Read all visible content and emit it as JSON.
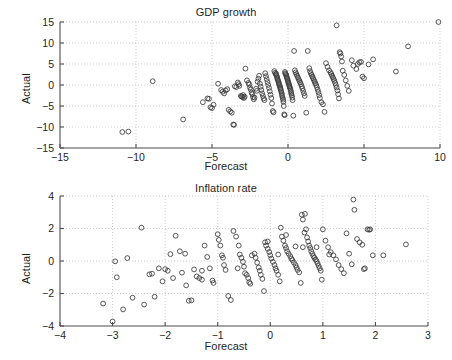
{
  "figure": {
    "background_color": "#ffffff",
    "axis_color": "#4d4d4d",
    "grid_color": "#b9b9b9",
    "marker_color": "#3a3a3a",
    "marker_shape": "open-circle"
  },
  "panels": [
    {
      "id": "gdp",
      "title": "GDP growth",
      "xlabel": "Forecast",
      "ylabel": "Actual"
    },
    {
      "id": "inflation",
      "title": "Inflation rate",
      "xlabel": "Forecast",
      "ylabel": "Actual"
    }
  ],
  "chart_data": [
    {
      "type": "scatter",
      "title": "GDP growth",
      "xlabel": "Forecast",
      "ylabel": "Actual",
      "xlim": [
        -15,
        10
      ],
      "ylim": [
        -15,
        15
      ],
      "xticks": [
        -15,
        -10,
        -5,
        0,
        5,
        10
      ],
      "yticks": [
        -15,
        -10,
        -5,
        0,
        5,
        10,
        15
      ],
      "xticklabels": [
        "−15",
        "−10",
        "−5",
        "0",
        "5",
        "10"
      ],
      "yticklabels": [
        "−15",
        "−10",
        "−5",
        "0",
        "5",
        "10",
        "15"
      ],
      "grid": true,
      "grid_style": "dotted",
      "legend": null,
      "marker": "o",
      "marker_filled": false,
      "points": [
        [
          -10.9,
          -11.2
        ],
        [
          -10.5,
          -11.1
        ],
        [
          -8.9,
          0.9
        ],
        [
          -6.9,
          -8.2
        ],
        [
          -5.6,
          -4.1
        ],
        [
          -5.3,
          -3.2
        ],
        [
          -5.2,
          -3.3
        ],
        [
          -5.1,
          -5.3
        ],
        [
          -5.0,
          -5.5
        ],
        [
          -4.9,
          -4.7
        ],
        [
          -4.6,
          0.3
        ],
        [
          -4.4,
          -1.2
        ],
        [
          -4.3,
          -1.6
        ],
        [
          -4.2,
          -2.0
        ],
        [
          -4.1,
          -1.3
        ],
        [
          -4.0,
          -1.0
        ],
        [
          -3.9,
          -5.9
        ],
        [
          -3.8,
          -6.3
        ],
        [
          -3.7,
          -6.6
        ],
        [
          -3.6,
          -9.4
        ],
        [
          -3.55,
          -9.5
        ],
        [
          -3.5,
          -0.3
        ],
        [
          -3.4,
          -0.5
        ],
        [
          -3.3,
          0.6
        ],
        [
          -3.25,
          0.2
        ],
        [
          -3.2,
          -0.2
        ],
        [
          -3.1,
          -2.6
        ],
        [
          -3.05,
          -2.7
        ],
        [
          -3.0,
          -2.9
        ],
        [
          -2.95,
          -2.4
        ],
        [
          -2.9,
          -3.1
        ],
        [
          -2.85,
          -2.8
        ],
        [
          -2.8,
          3.9
        ],
        [
          -2.7,
          1.1
        ],
        [
          -2.6,
          0.5
        ],
        [
          -2.55,
          0.1
        ],
        [
          -2.5,
          -0.6
        ],
        [
          -2.45,
          -1.1
        ],
        [
          -2.4,
          -1.8
        ],
        [
          -2.35,
          -2.2
        ],
        [
          -2.3,
          -2.9
        ],
        [
          -2.25,
          -3.4
        ],
        [
          -2.2,
          -3.0
        ],
        [
          -2.1,
          -0.9
        ],
        [
          -2.05,
          -1.4
        ],
        [
          -2.0,
          0.8
        ],
        [
          -1.95,
          1.5
        ],
        [
          -1.9,
          2.2
        ],
        [
          -1.85,
          0.3
        ],
        [
          -1.8,
          -0.4
        ],
        [
          -1.75,
          -1.2
        ],
        [
          -1.7,
          -2.0
        ],
        [
          -1.65,
          -2.6
        ],
        [
          -1.6,
          -3.2
        ],
        [
          -1.55,
          -3.6
        ],
        [
          -1.5,
          2.8
        ],
        [
          -1.45,
          2.1
        ],
        [
          -1.4,
          1.4
        ],
        [
          -1.35,
          0.7
        ],
        [
          -1.3,
          0.0
        ],
        [
          -1.25,
          -0.7
        ],
        [
          -1.2,
          -1.5
        ],
        [
          -1.15,
          -2.3
        ],
        [
          -1.1,
          -3.1
        ],
        [
          -1.05,
          -4.4
        ],
        [
          -1.0,
          -6.2
        ],
        [
          -0.95,
          -6.5
        ],
        [
          -0.9,
          3.3
        ],
        [
          -0.85,
          2.9
        ],
        [
          -0.8,
          2.5
        ],
        [
          -0.78,
          2.7
        ],
        [
          -0.75,
          2.2
        ],
        [
          -0.72,
          1.9
        ],
        [
          -0.7,
          1.6
        ],
        [
          -0.68,
          1.3
        ],
        [
          -0.65,
          1.0
        ],
        [
          -0.62,
          0.7
        ],
        [
          -0.6,
          0.4
        ],
        [
          -0.58,
          0.1
        ],
        [
          -0.55,
          -0.2
        ],
        [
          -0.52,
          -0.5
        ],
        [
          -0.5,
          -0.8
        ],
        [
          -0.48,
          -1.1
        ],
        [
          -0.45,
          -1.5
        ],
        [
          -0.42,
          -1.9
        ],
        [
          -0.4,
          -2.3
        ],
        [
          -0.38,
          -2.7
        ],
        [
          -0.35,
          -3.1
        ],
        [
          -0.32,
          -3.5
        ],
        [
          -0.3,
          -4.0
        ],
        [
          -0.28,
          -5.0
        ],
        [
          -0.25,
          -7.0
        ],
        [
          -0.22,
          -7.2
        ],
        [
          -0.2,
          3.1
        ],
        [
          -0.18,
          2.8
        ],
        [
          -0.15,
          2.6
        ],
        [
          -0.12,
          2.4
        ],
        [
          -0.1,
          2.1
        ],
        [
          -0.08,
          1.8
        ],
        [
          -0.05,
          1.5
        ],
        [
          -0.02,
          1.2
        ],
        [
          0.0,
          0.9
        ],
        [
          0.02,
          0.6
        ],
        [
          0.05,
          0.3
        ],
        [
          0.08,
          0.0
        ],
        [
          0.1,
          -0.3
        ],
        [
          0.12,
          -0.6
        ],
        [
          0.15,
          -0.9
        ],
        [
          0.18,
          -1.3
        ],
        [
          0.2,
          -1.7
        ],
        [
          0.22,
          -2.1
        ],
        [
          0.25,
          -2.5
        ],
        [
          0.28,
          -3.0
        ],
        [
          0.3,
          -3.6
        ],
        [
          0.35,
          -7.3
        ],
        [
          0.4,
          8.1
        ],
        [
          0.45,
          3.5
        ],
        [
          0.5,
          3.0
        ],
        [
          0.55,
          2.6
        ],
        [
          0.6,
          2.2
        ],
        [
          0.65,
          1.8
        ],
        [
          0.7,
          1.4
        ],
        [
          0.75,
          1.0
        ],
        [
          0.8,
          0.6
        ],
        [
          0.85,
          0.2
        ],
        [
          0.9,
          -0.3
        ],
        [
          0.95,
          -0.8
        ],
        [
          1.0,
          -1.4
        ],
        [
          1.05,
          -2.0
        ],
        [
          1.1,
          -2.6
        ],
        [
          1.2,
          -6.6
        ],
        [
          1.3,
          8.1
        ],
        [
          1.4,
          4.0
        ],
        [
          1.45,
          3.3
        ],
        [
          1.5,
          2.8
        ],
        [
          1.55,
          2.4
        ],
        [
          1.6,
          2.0
        ],
        [
          1.65,
          1.6
        ],
        [
          1.7,
          1.2
        ],
        [
          1.75,
          0.8
        ],
        [
          1.8,
          0.4
        ],
        [
          1.85,
          0.0
        ],
        [
          1.9,
          -0.5
        ],
        [
          1.95,
          -1.1
        ],
        [
          2.0,
          -1.7
        ],
        [
          2.05,
          -2.4
        ],
        [
          2.1,
          -3.1
        ],
        [
          2.2,
          -4.1
        ],
        [
          2.3,
          -4.6
        ],
        [
          2.4,
          -6.4
        ],
        [
          2.5,
          5.2
        ],
        [
          2.6,
          4.3
        ],
        [
          2.7,
          3.5
        ],
        [
          2.8,
          3.0
        ],
        [
          2.85,
          2.6
        ],
        [
          2.9,
          2.2
        ],
        [
          2.95,
          1.8
        ],
        [
          3.0,
          1.4
        ],
        [
          3.05,
          1.0
        ],
        [
          3.1,
          0.5
        ],
        [
          3.15,
          0.0
        ],
        [
          3.2,
          -0.6
        ],
        [
          3.25,
          -1.3
        ],
        [
          3.3,
          -2.2
        ],
        [
          3.35,
          -3.2
        ],
        [
          3.2,
          14.2
        ],
        [
          3.4,
          7.8
        ],
        [
          3.45,
          7.5
        ],
        [
          3.5,
          6.8
        ],
        [
          3.55,
          5.6
        ],
        [
          3.6,
          3.4
        ],
        [
          3.7,
          2.4
        ],
        [
          3.8,
          1.1
        ],
        [
          3.9,
          -0.2
        ],
        [
          4.0,
          -1.4
        ],
        [
          4.2,
          5.9
        ],
        [
          4.3,
          4.6
        ],
        [
          4.5,
          3.8
        ],
        [
          4.6,
          5.0
        ],
        [
          4.7,
          5.4
        ],
        [
          4.8,
          5.5
        ],
        [
          4.9,
          2.0
        ],
        [
          5.0,
          1.6
        ],
        [
          5.3,
          4.9
        ],
        [
          5.6,
          6.1
        ],
        [
          7.1,
          3.2
        ],
        [
          7.9,
          9.2
        ],
        [
          9.9,
          15.0
        ]
      ]
    },
    {
      "type": "scatter",
      "title": "Inflation rate",
      "xlabel": "Forecast",
      "ylabel": "Actual",
      "xlim": [
        -4,
        3
      ],
      "ylim": [
        -4,
        4
      ],
      "xticks": [
        -4,
        -3,
        -2,
        -1,
        0,
        1,
        2,
        3
      ],
      "yticks": [
        -4,
        -2,
        0,
        2,
        4
      ],
      "xticklabels": [
        "−4",
        "−3",
        "−2",
        "−1",
        "0",
        "1",
        "2",
        "3"
      ],
      "yticklabels": [
        "−4",
        "−2",
        "0",
        "2",
        "4"
      ],
      "grid": true,
      "grid_style": "dotted",
      "legend": null,
      "marker": "o",
      "marker_filled": false,
      "points": [
        [
          -3.18,
          -2.62
        ],
        [
          -3.0,
          -3.72
        ],
        [
          -2.95,
          -0.02
        ],
        [
          -2.92,
          -1.0
        ],
        [
          -2.8,
          -2.98
        ],
        [
          -2.72,
          0.18
        ],
        [
          -2.62,
          -2.26
        ],
        [
          -2.45,
          2.05
        ],
        [
          -2.4,
          -2.68
        ],
        [
          -2.3,
          -0.82
        ],
        [
          -2.25,
          -0.78
        ],
        [
          -2.2,
          -2.2
        ],
        [
          -2.12,
          -0.45
        ],
        [
          -2.05,
          -1.25
        ],
        [
          -2.0,
          -0.5
        ],
        [
          -1.95,
          -0.6
        ],
        [
          -1.9,
          0.42
        ],
        [
          -1.85,
          -1.05
        ],
        [
          -1.8,
          1.55
        ],
        [
          -1.72,
          0.6
        ],
        [
          -1.68,
          -0.72
        ],
        [
          -1.6,
          -1.5
        ],
        [
          -1.55,
          -2.45
        ],
        [
          -1.5,
          -2.42
        ],
        [
          -1.45,
          -0.52
        ],
        [
          -1.4,
          -0.95
        ],
        [
          -1.35,
          -1.05
        ],
        [
          -1.3,
          -0.6
        ],
        [
          -1.25,
          0.95
        ],
        [
          -1.2,
          0.25
        ],
        [
          -1.15,
          -0.45
        ],
        [
          -1.1,
          -1.2
        ],
        [
          -1.08,
          -1.35
        ],
        [
          -1.0,
          1.65
        ],
        [
          -0.98,
          1.3
        ],
        [
          -0.95,
          0.95
        ],
        [
          -0.92,
          0.35
        ],
        [
          -0.88,
          -0.25
        ],
        [
          -0.85,
          -0.55
        ],
        [
          -0.8,
          -2.15
        ],
        [
          -0.75,
          -2.4
        ],
        [
          -0.7,
          1.85
        ],
        [
          -0.65,
          1.5
        ],
        [
          -0.6,
          0.95
        ],
        [
          -0.58,
          0.4
        ],
        [
          -0.55,
          0.2
        ],
        [
          -0.52,
          -0.05
        ],
        [
          -0.5,
          -0.35
        ],
        [
          -0.48,
          -0.75
        ],
        [
          -0.45,
          -0.85
        ],
        [
          -0.42,
          -1.05
        ],
        [
          -0.4,
          -1.3
        ],
        [
          -0.38,
          -1.4
        ],
        [
          -0.3,
          0.45
        ],
        [
          -0.28,
          0.2
        ],
        [
          -0.25,
          -0.1
        ],
        [
          -0.22,
          -0.4
        ],
        [
          -0.2,
          -0.6
        ],
        [
          -0.18,
          -0.85
        ],
        [
          -0.15,
          -1.1
        ],
        [
          -0.12,
          -1.85
        ],
        [
          -0.1,
          1.15
        ],
        [
          -0.08,
          0.95
        ],
        [
          -0.05,
          0.75
        ],
        [
          -0.02,
          0.55
        ],
        [
          0.0,
          0.35
        ],
        [
          0.02,
          0.15
        ],
        [
          0.05,
          -0.05
        ],
        [
          0.08,
          -0.25
        ],
        [
          0.1,
          -0.45
        ],
        [
          0.12,
          -0.6
        ],
        [
          0.15,
          -0.85
        ],
        [
          0.18,
          -1.25
        ],
        [
          0.2,
          2.05
        ],
        [
          0.22,
          1.5
        ],
        [
          0.25,
          1.25
        ],
        [
          0.28,
          0.95
        ],
        [
          0.3,
          0.8
        ],
        [
          0.32,
          0.6
        ],
        [
          0.35,
          0.45
        ],
        [
          0.38,
          0.3
        ],
        [
          0.4,
          0.15
        ],
        [
          0.42,
          0.05
        ],
        [
          0.45,
          -0.1
        ],
        [
          0.48,
          -0.25
        ],
        [
          0.5,
          -0.4
        ],
        [
          0.52,
          -0.55
        ],
        [
          0.55,
          -0.7
        ],
        [
          0.58,
          -1.35
        ],
        [
          0.6,
          2.85
        ],
        [
          0.62,
          2.55
        ],
        [
          0.65,
          1.75
        ],
        [
          0.66,
          2.9
        ],
        [
          0.68,
          1.95
        ],
        [
          0.7,
          1.45
        ],
        [
          0.72,
          1.2
        ],
        [
          0.74,
          0.95
        ],
        [
          0.76,
          0.8
        ],
        [
          0.78,
          0.6
        ],
        [
          0.8,
          0.45
        ],
        [
          0.82,
          0.3
        ],
        [
          0.84,
          0.2
        ],
        [
          0.86,
          0.1
        ],
        [
          0.88,
          0.0
        ],
        [
          0.9,
          -0.15
        ],
        [
          0.92,
          -0.3
        ],
        [
          0.94,
          -0.45
        ],
        [
          0.96,
          -0.6
        ],
        [
          0.98,
          -1.15
        ],
        [
          1.0,
          1.95
        ],
        [
          1.05,
          1.25
        ],
        [
          1.1,
          0.85
        ],
        [
          1.15,
          0.55
        ],
        [
          1.2,
          0.35
        ],
        [
          1.25,
          0.1
        ],
        [
          1.3,
          -0.25
        ],
        [
          1.35,
          -0.5
        ],
        [
          1.4,
          -0.75
        ],
        [
          1.45,
          1.7
        ],
        [
          1.5,
          0.45
        ],
        [
          1.55,
          -0.2
        ],
        [
          1.58,
          3.78
        ],
        [
          1.6,
          3.15
        ],
        [
          1.65,
          1.35
        ],
        [
          1.7,
          1.15
        ],
        [
          1.75,
          1.0
        ],
        [
          1.78,
          -0.5
        ],
        [
          1.8,
          -0.45
        ],
        [
          1.85,
          1.95
        ],
        [
          1.88,
          1.92
        ],
        [
          1.9,
          1.95
        ],
        [
          1.95,
          0.35
        ],
        [
          2.15,
          0.35
        ],
        [
          2.58,
          1.02
        ],
        [
          -1.62,
          0.45
        ],
        [
          -1.3,
          -1.15
        ],
        [
          -0.35,
          0.35
        ],
        [
          0.15,
          0.4
        ],
        [
          0.62,
          0.85
        ],
        [
          0.88,
          0.85
        ],
        [
          1.12,
          0.4
        ],
        [
          -0.62,
          -0.45
        ],
        [
          -0.9,
          0.2
        ],
        [
          0.48,
          0.9
        ],
        [
          -0.05,
          1.2
        ],
        [
          0.3,
          1.6
        ]
      ]
    }
  ]
}
